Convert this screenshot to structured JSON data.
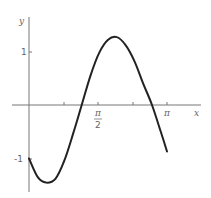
{
  "chart_data": {
    "type": "line",
    "title": "",
    "xlabel": "x",
    "ylabel": "y",
    "x_ticks": [
      {
        "value": 0.7854,
        "label": ""
      },
      {
        "value": 1.5708,
        "label": "π/2"
      },
      {
        "value": 2.3562,
        "label": ""
      },
      {
        "value": 3.1416,
        "label": "π"
      }
    ],
    "y_ticks": [
      {
        "value": 1,
        "label": "1"
      },
      {
        "value": -1,
        "label": "-1"
      }
    ],
    "xlim": [
      -0.7,
      3.6
    ],
    "ylim": [
      -1.6,
      1.6
    ],
    "grid": false,
    "series": [
      {
        "name": "curve",
        "x": [
          0,
          0.2,
          0.39,
          0.6,
          0.8,
          1.0,
          1.2,
          1.4,
          1.6,
          1.8,
          2.0,
          2.2,
          2.4,
          2.6,
          2.8,
          3.0,
          3.1416
        ],
        "y": [
          -1.0,
          -1.35,
          -1.45,
          -1.38,
          -1.05,
          -0.55,
          0.0,
          0.55,
          0.98,
          1.22,
          1.27,
          1.12,
          0.82,
          0.4,
          0.0,
          -0.5,
          -0.87
        ]
      }
    ]
  },
  "labels": {
    "x_axis": "x",
    "y_axis": "y",
    "pi_half_num": "π",
    "pi_half_den": "2",
    "pi": "π",
    "y_one": "1",
    "y_neg_one": "-1"
  }
}
